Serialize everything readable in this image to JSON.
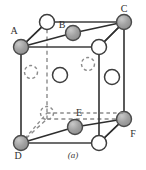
{
  "figure": {
    "caption": "(a)",
    "colors": {
      "shaded_atom_fill": "#9a9a9a",
      "shaded_atom_stroke": "#4a4a4a",
      "open_atom_fill": "#ffffff",
      "open_atom_stroke": "#3d3d3d",
      "solid_edge": "#3d3d3d",
      "hidden_edge": "#8c8c8c",
      "bond_line": "#2e2e2e",
      "label_color": "#2e2e2e",
      "background": "#ffffff"
    },
    "labels": [
      {
        "id": "label-A",
        "text": "A",
        "x": 14,
        "y": 34
      },
      {
        "id": "label-B",
        "text": "B",
        "x": 62,
        "y": 28
      },
      {
        "id": "label-C",
        "text": "C",
        "x": 124,
        "y": 12
      },
      {
        "id": "label-D",
        "text": "D",
        "x": 18,
        "y": 157
      },
      {
        "id": "label-E",
        "text": "E",
        "x": 79,
        "y": 116
      },
      {
        "id": "label-F",
        "text": "F",
        "x": 131,
        "y": 137
      }
    ],
    "cube": {
      "front_face": [
        {
          "x": 21,
          "y": 47
        },
        {
          "x": 99,
          "y": 47
        },
        {
          "x": 99,
          "y": 143
        },
        {
          "x": 21,
          "y": 143
        }
      ],
      "back_face": [
        {
          "x": 47,
          "y": 22
        },
        {
          "x": 124,
          "y": 22
        },
        {
          "x": 124,
          "y": 119
        },
        {
          "x": 47,
          "y": 119
        }
      ]
    },
    "atoms": [
      {
        "id": "atom-A",
        "type": "shaded",
        "x": 21,
        "y": 47,
        "r": 7.5
      },
      {
        "id": "atom-C",
        "type": "shaded",
        "x": 124,
        "y": 22,
        "r": 7.5
      },
      {
        "id": "atom-D",
        "type": "shaded",
        "x": 21,
        "y": 143,
        "r": 7.5
      },
      {
        "id": "atom-F",
        "type": "shaded",
        "x": 124,
        "y": 119,
        "r": 7.5
      },
      {
        "id": "atom-B",
        "type": "shaded",
        "x": 73,
        "y": 33,
        "r": 7.5
      },
      {
        "id": "atom-E",
        "type": "shaded",
        "x": 75,
        "y": 127,
        "r": 7.5
      },
      {
        "id": "atom-back-top-left",
        "type": "open",
        "x": 47,
        "y": 22,
        "r": 7.5
      },
      {
        "id": "atom-front-top-right",
        "type": "open",
        "x": 99,
        "y": 47,
        "r": 7.5
      },
      {
        "id": "atom-front-bottom-right",
        "type": "open",
        "x": 99,
        "y": 143,
        "r": 7.5
      },
      {
        "id": "atom-interior-center-left",
        "type": "open",
        "x": 60,
        "y": 75,
        "r": 7.5
      },
      {
        "id": "atom-interior-right",
        "type": "open",
        "x": 112,
        "y": 77,
        "r": 7.5
      }
    ],
    "hidden_atoms": [
      {
        "id": "hidden-atom-left",
        "type": "dashed",
        "x": 31,
        "y": 72,
        "r": 6.5
      },
      {
        "id": "hidden-atom-upper-right",
        "type": "dashed",
        "x": 88,
        "y": 64,
        "r": 6.5
      },
      {
        "id": "hidden-atom-lower-left",
        "type": "dashed",
        "x": 47,
        "y": 113,
        "r": 6.5
      }
    ],
    "bonds": [
      {
        "id": "bond-A-backtopleft",
        "x1": 21,
        "y1": 47,
        "x2": 47,
        "y2": 22
      },
      {
        "id": "bond-A-B",
        "x1": 21,
        "y1": 47,
        "x2": 73,
        "y2": 33
      },
      {
        "id": "bond-B-C",
        "x1": 73,
        "y1": 33,
        "x2": 124,
        "y2": 22
      },
      {
        "id": "bond-C-fronttopright",
        "x1": 124,
        "y1": 22,
        "x2": 99,
        "y2": 47
      },
      {
        "id": "bond-D-E",
        "x1": 21,
        "y1": 143,
        "x2": 75,
        "y2": 127
      },
      {
        "id": "bond-E-F",
        "x1": 75,
        "y1": 127,
        "x2": 124,
        "y2": 119
      },
      {
        "id": "bond-F-frontbottomright",
        "x1": 124,
        "y1": 119,
        "x2": 99,
        "y2": 143
      },
      {
        "id": "bond-D-hiddenlowerleft",
        "x1": 21,
        "y1": 143,
        "x2": 47,
        "y2": 113
      }
    ]
  }
}
